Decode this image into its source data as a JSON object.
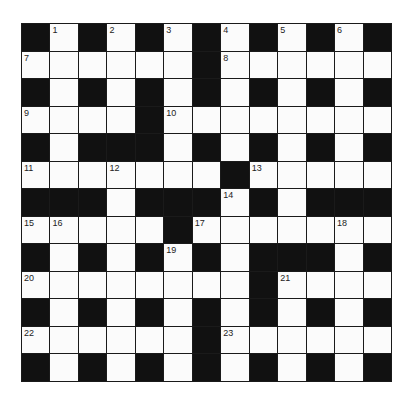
{
  "puzzle": {
    "rows": 13,
    "cols": 13,
    "colors": {
      "block": "#111111",
      "cell": "#fbfbfb",
      "border": "#1a1a1a"
    },
    "layout": [
      "#.#.#.#.#.#.#",
      "......#......",
      "#.#.#.#.#.#.#",
      "....#........",
      "#.###.#.#.#.#",
      ".......#.....",
      "###.###.#.###",
      ".....#.......",
      "#.#.#.#.###.#",
      "........#....",
      "#.#.#.#.#.#.#",
      "......#......",
      "#.#.#.#.#.#.#"
    ],
    "numbers": [
      {
        "r": 0,
        "c": 1,
        "n": "1"
      },
      {
        "r": 0,
        "c": 3,
        "n": "2"
      },
      {
        "r": 0,
        "c": 5,
        "n": "3"
      },
      {
        "r": 0,
        "c": 7,
        "n": "4"
      },
      {
        "r": 0,
        "c": 9,
        "n": "5"
      },
      {
        "r": 0,
        "c": 11,
        "n": "6"
      },
      {
        "r": 1,
        "c": 0,
        "n": "7"
      },
      {
        "r": 1,
        "c": 7,
        "n": "8"
      },
      {
        "r": 3,
        "c": 0,
        "n": "9"
      },
      {
        "r": 3,
        "c": 5,
        "n": "10"
      },
      {
        "r": 5,
        "c": 0,
        "n": "11"
      },
      {
        "r": 5,
        "c": 3,
        "n": "12"
      },
      {
        "r": 5,
        "c": 8,
        "n": "13"
      },
      {
        "r": 6,
        "c": 7,
        "n": "14"
      },
      {
        "r": 7,
        "c": 0,
        "n": "15"
      },
      {
        "r": 7,
        "c": 1,
        "n": "16"
      },
      {
        "r": 7,
        "c": 6,
        "n": "17"
      },
      {
        "r": 7,
        "c": 11,
        "n": "18"
      },
      {
        "r": 8,
        "c": 5,
        "n": "19"
      },
      {
        "r": 9,
        "c": 0,
        "n": "20"
      },
      {
        "r": 9,
        "c": 9,
        "n": "21"
      },
      {
        "r": 11,
        "c": 0,
        "n": "22"
      },
      {
        "r": 11,
        "c": 7,
        "n": "23"
      }
    ]
  }
}
